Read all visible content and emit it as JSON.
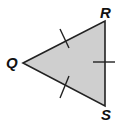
{
  "diagram": {
    "type": "triangle",
    "vertices": [
      {
        "label": "Q",
        "x": 23,
        "y": 63
      },
      {
        "label": "R",
        "x": 105,
        "y": 21
      },
      {
        "label": "S",
        "x": 105,
        "y": 106
      }
    ],
    "fill_color": "#cfcfcf",
    "stroke_color": "#222222",
    "tick_marks": [
      {
        "side": "QR",
        "count": 1
      },
      {
        "side": "RS",
        "count": 1
      },
      {
        "side": "QS",
        "count": 1
      }
    ],
    "labels": {
      "q": "Q",
      "r": "R",
      "s": "S"
    }
  }
}
